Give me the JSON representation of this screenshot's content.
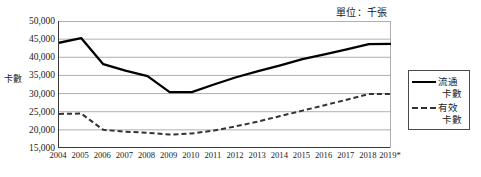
{
  "unit_note": "單位：千張",
  "y_axis_title": "卡數",
  "legend": {
    "entries": [
      {
        "label_line1": "流通",
        "label_line2": "卡數",
        "style": "solid",
        "color": "#000000"
      },
      {
        "label_line1": "有效",
        "label_line2": "卡數",
        "style": "dashed",
        "color": "#333333"
      }
    ]
  },
  "chart_data": {
    "type": "line",
    "title": "",
    "subtitle": "",
    "xlabel": "",
    "ylabel": "卡數",
    "unit": "單位：千張",
    "grid": true,
    "legend_position": "right",
    "ylim": [
      15000,
      50000
    ],
    "ytick_step": 5000,
    "yticks": [
      50000,
      45000,
      40000,
      35000,
      30000,
      25000,
      20000,
      15000
    ],
    "ytick_labels": [
      "50,000",
      "45,000",
      "40,000",
      "35,000",
      "30,000",
      "25,000",
      "20,000",
      "15,000"
    ],
    "categories": [
      "2004",
      "2005",
      "2006",
      "2007",
      "2008",
      "2009",
      "2010",
      "2011",
      "2012",
      "2013",
      "2014",
      "2015",
      "2016",
      "2017",
      "2018",
      "2019*"
    ],
    "series": [
      {
        "name": "流通卡數",
        "style": "solid",
        "color": "#000000",
        "values": [
          44000,
          45300,
          38100,
          36300,
          34800,
          30400,
          30400,
          32500,
          34500,
          36200,
          37800,
          39500,
          40800,
          42200,
          43600,
          43700
        ]
      },
      {
        "name": "有效卡數",
        "style": "dashed",
        "color": "#333333",
        "values": [
          24400,
          24500,
          20000,
          19500,
          19200,
          18700,
          19000,
          19800,
          21000,
          22300,
          23800,
          25300,
          26800,
          28300,
          29900,
          29900
        ]
      }
    ]
  }
}
